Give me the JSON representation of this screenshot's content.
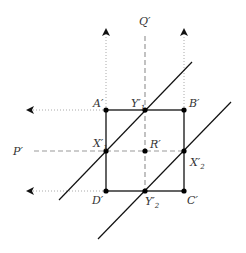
{
  "diagram": {
    "colors": {
      "line": "#111111",
      "dashed": "#999999",
      "dotted": "#aaaaaa",
      "point": "#000000",
      "label": "#333333"
    },
    "axes": {
      "Q": {
        "label": "Q",
        "prime": "′"
      },
      "P": {
        "label": "P",
        "prime": "′"
      }
    },
    "points": {
      "A": {
        "label": "A",
        "prime": "′"
      },
      "B": {
        "label": "B",
        "prime": "′"
      },
      "C": {
        "label": "C",
        "prime": "′"
      },
      "D": {
        "label": "D",
        "prime": "′"
      },
      "R": {
        "label": "R",
        "prime": "′"
      },
      "Y1": {
        "label": "Y",
        "prime": "′",
        "sub": "1"
      },
      "Y2": {
        "label": "Y",
        "prime": "′",
        "sub": "2"
      },
      "X1": {
        "label": "X",
        "prime": "′",
        "sub": "1"
      },
      "X2": {
        "label": "X",
        "prime": "′",
        "sub": "2"
      }
    }
  }
}
